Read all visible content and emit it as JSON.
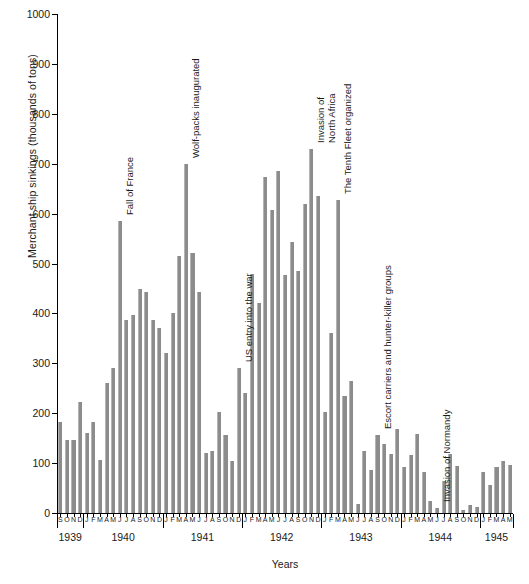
{
  "chart_data": {
    "type": "bar",
    "title": "",
    "xlabel": "Years",
    "ylabel": "Merchant ship sinkings (thousands of tons)",
    "ylim": [
      0,
      1000
    ],
    "yticks": [
      0,
      100,
      200,
      300,
      400,
      500,
      600,
      700,
      800,
      900,
      1000
    ],
    "ytick_labels": [
      "0",
      "100",
      "200",
      "300",
      "400",
      "500",
      "600",
      "700",
      "800",
      "900",
      "1000"
    ],
    "grid": false,
    "legend": null,
    "bar_color": "#8c8c8c",
    "years": [
      {
        "label": "1939",
        "months": [
          "S",
          "O",
          "N",
          "D"
        ]
      },
      {
        "label": "1940",
        "months": [
          "J",
          "F",
          "M",
          "A",
          "M",
          "J",
          "J",
          "A",
          "S",
          "O",
          "N",
          "D"
        ]
      },
      {
        "label": "1941",
        "months": [
          "J",
          "F",
          "M",
          "A",
          "M",
          "J",
          "J",
          "A",
          "S",
          "O",
          "N",
          "D"
        ]
      },
      {
        "label": "1942",
        "months": [
          "J",
          "F",
          "M",
          "A",
          "M",
          "J",
          "J",
          "A",
          "S",
          "O",
          "N",
          "D"
        ]
      },
      {
        "label": "1943",
        "months": [
          "J",
          "F",
          "M",
          "A",
          "M",
          "J",
          "J",
          "A",
          "S",
          "O",
          "N",
          "D"
        ]
      },
      {
        "label": "1944",
        "months": [
          "J",
          "F",
          "M",
          "A",
          "M",
          "J",
          "J",
          "A",
          "S",
          "O",
          "N",
          "D"
        ]
      },
      {
        "label": "1945",
        "months": [
          "J",
          "F",
          "M",
          "A",
          "M"
        ]
      }
    ],
    "categories": [
      "1939-S",
      "1939-O",
      "1939-N",
      "1939-D",
      "1940-J",
      "1940-F",
      "1940-M",
      "1940-A",
      "1940-M",
      "1940-J",
      "1940-J",
      "1940-A",
      "1940-S",
      "1940-O",
      "1940-N",
      "1940-D",
      "1941-J",
      "1941-F",
      "1941-M",
      "1941-A",
      "1941-M",
      "1941-J",
      "1941-J",
      "1941-A",
      "1941-S",
      "1941-O",
      "1941-N",
      "1941-D",
      "1942-J",
      "1942-F",
      "1942-M",
      "1942-A",
      "1942-M",
      "1942-J",
      "1942-J",
      "1942-A",
      "1942-S",
      "1942-O",
      "1942-N",
      "1942-D",
      "1943-J",
      "1943-F",
      "1943-M",
      "1943-A",
      "1943-M",
      "1943-J",
      "1943-J",
      "1943-A",
      "1943-S",
      "1943-O",
      "1943-N",
      "1943-D",
      "1944-J",
      "1944-F",
      "1944-M",
      "1944-A",
      "1944-M",
      "1944-J",
      "1944-J",
      "1944-A",
      "1944-S",
      "1944-O",
      "1944-N",
      "1944-D",
      "1945-J",
      "1945-F",
      "1945-M",
      "1945-A",
      "1945-M"
    ],
    "values": [
      182,
      147,
      147,
      222,
      160,
      182,
      107,
      260,
      290,
      585,
      386,
      397,
      448,
      442,
      386,
      370,
      320,
      400,
      515,
      700,
      522,
      442,
      120,
      125,
      202,
      157,
      104,
      290,
      240,
      479,
      420,
      674,
      607,
      685,
      477,
      544,
      485,
      619,
      729,
      636,
      203,
      360,
      627,
      235,
      265,
      18,
      124,
      86,
      156,
      139,
      119,
      169,
      93,
      117,
      158,
      82,
      24,
      11,
      64,
      119,
      95,
      7,
      16,
      12,
      82,
      57,
      93,
      104,
      97
    ],
    "annotations": [
      {
        "label": "Fall of France",
        "line1": "Fall of France",
        "line2": "",
        "month_index": 9
      },
      {
        "label": "Wolf-packs inaugurated",
        "line1": "Wolf-packs inaugurated",
        "line2": "",
        "month_index": 19
      },
      {
        "label": "US entry into the war",
        "line1": "US entry into the war",
        "line2": "",
        "month_index": 27
      },
      {
        "label": "Invasion of North Africa",
        "line1": "Invasion of",
        "line2": "North Africa",
        "month_index": 38
      },
      {
        "label": "The Tenth Fleet organized",
        "line1": "The  Tenth Fleet organized",
        "line2": "",
        "month_index": 42
      },
      {
        "label": "Escort carriers and hunter-killer groups",
        "line1": "Escort carriers and hunter-killer  groups",
        "line2": "",
        "month_index": 48
      },
      {
        "label": "Invasion of Normandy",
        "line1": "Invasion of Normandy",
        "line2": "",
        "month_index": 57
      }
    ]
  }
}
